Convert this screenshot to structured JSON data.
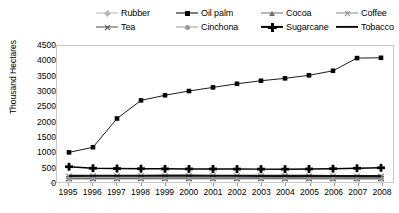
{
  "chart_data": {
    "type": "line",
    "title": "",
    "xlabel": "",
    "ylabel": "Thousand Hectares",
    "ylim": [
      0,
      4500
    ],
    "ytick_step": 500,
    "grid": false,
    "legend_position": "top",
    "categories": [
      "1995",
      "1996",
      "1997",
      "1998",
      "1999",
      "2000",
      "2001",
      "2002",
      "2003",
      "2004",
      "2005",
      "2006",
      "2007",
      "2008"
    ],
    "series": [
      {
        "name": "Rubber",
        "marker": "diamond",
        "color": "#b9b9b9",
        "values": [
          150,
          152,
          155,
          158,
          160,
          162,
          165,
          168,
          170,
          172,
          175,
          178,
          180,
          182
        ]
      },
      {
        "name": "Oil palm",
        "marker": "square",
        "color": "#000000",
        "values": [
          980,
          1150,
          2100,
          2700,
          2870,
          3010,
          3130,
          3250,
          3350,
          3430,
          3530,
          3680,
          4100,
          4110
        ]
      },
      {
        "name": "Cocoa",
        "marker": "triangle",
        "color": "#6e6e6e",
        "values": [
          130,
          132,
          134,
          136,
          138,
          140,
          142,
          144,
          146,
          148,
          150,
          152,
          154,
          156
        ]
      },
      {
        "name": "Coffee",
        "marker": "x",
        "color": "#8a8a8a",
        "values": [
          190,
          192,
          194,
          196,
          198,
          200,
          200,
          198,
          196,
          194,
          192,
          190,
          188,
          186
        ]
      },
      {
        "name": "Tea",
        "marker": "x",
        "color": "#4a4a4a",
        "values": [
          110,
          112,
          114,
          116,
          118,
          118,
          118,
          117,
          116,
          115,
          114,
          113,
          112,
          111
        ]
      },
      {
        "name": "Cinchona",
        "marker": "circle",
        "color": "#9a9a9a",
        "values": [
          95,
          96,
          97,
          98,
          99,
          100,
          100,
          100,
          99,
          98,
          97,
          96,
          95,
          94
        ]
      },
      {
        "name": "Sugarcane",
        "marker": "plus",
        "color": "#000000",
        "values": [
          505,
          455,
          445,
          440,
          435,
          432,
          430,
          428,
          426,
          424,
          430,
          440,
          455,
          470
        ]
      },
      {
        "name": "Tobacco",
        "marker": "none",
        "color": "#111111",
        "values": [
          205,
          206,
          207,
          208,
          209,
          210,
          208,
          206,
          204,
          202,
          200,
          198,
          196,
          194
        ]
      }
    ]
  },
  "axes": {
    "y_title": "Thousand Hectares",
    "y_ticks": [
      "4500",
      "4000",
      "3500",
      "3000",
      "2500",
      "2000",
      "1500",
      "1000",
      "500",
      "0"
    ],
    "x_ticks": [
      "1995",
      "1996",
      "1997",
      "1998",
      "1999",
      "2000",
      "2001",
      "2002",
      "2003",
      "2004",
      "2005",
      "2006",
      "2007",
      "2008"
    ]
  },
  "legend": {
    "row1": [
      {
        "label": "Rubber",
        "marker": "diamond",
        "color": "#b9b9b9",
        "thick": false
      },
      {
        "label": "Oil palm",
        "marker": "square",
        "color": "#000000",
        "thick": false
      },
      {
        "label": "Cocoa",
        "marker": "triangle",
        "color": "#6e6e6e",
        "thick": false
      },
      {
        "label": "Coffee",
        "marker": "x",
        "color": "#8a8a8a",
        "thick": false
      }
    ],
    "row2": [
      {
        "label": "Tea",
        "marker": "x",
        "color": "#4a4a4a",
        "thick": false
      },
      {
        "label": "Cinchona",
        "marker": "circle",
        "color": "#9a9a9a",
        "thick": false
      },
      {
        "label": "Sugarcane",
        "marker": "plus",
        "color": "#000000",
        "thick": true
      },
      {
        "label": "Tobacco",
        "marker": "none",
        "color": "#111111",
        "thick": true
      }
    ]
  },
  "footnote": "",
  "colors": {
    "plot_border": "#c8c8c8",
    "background": "#ffffff"
  }
}
